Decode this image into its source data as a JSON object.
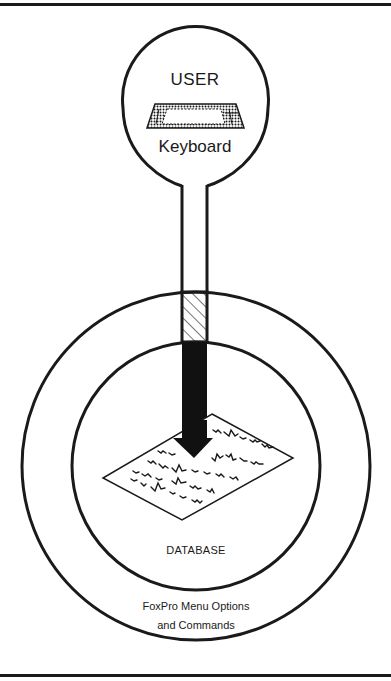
{
  "diagram": {
    "user_node": {
      "title": "USER",
      "device_label": "Keyboard",
      "icon": "keyboard-icon"
    },
    "inner_circle": {
      "label": "DATABASE",
      "icon": "document-sheet-icon"
    },
    "outer_ring": {
      "label_line1": "FoxPro Menu Options",
      "label_line2": "and Commands"
    },
    "connector": {
      "segments": [
        "plain-stem",
        "hatched-through-menu-layer",
        "solid-arrow-into-database"
      ]
    },
    "colors": {
      "ink": "#1a1a1a",
      "background": "#ffffff"
    }
  }
}
